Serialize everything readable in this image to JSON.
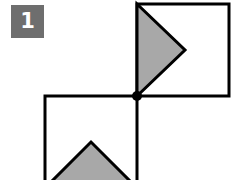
{
  "figure": {
    "label": "1",
    "badge": {
      "icon": "number-badge",
      "fill_color": "#6e6e6e",
      "text_color": "#ffffff",
      "x": 11,
      "y": 5,
      "width": 33,
      "height": 33
    },
    "canvas": {
      "width": 235,
      "height": 180,
      "background_color": "#ffffff"
    },
    "style": {
      "stroke_color": "#000000",
      "stroke_width": 3,
      "shaded_fill_color": "#a8a8a8",
      "unshaded_fill_color": "#ffffff",
      "vertex_dot_color": "#000000"
    },
    "shapes": [
      {
        "name": "upper-right-square",
        "type": "square",
        "points": "137,4 229,4 229,96 137,96",
        "fill": "#ffffff"
      },
      {
        "name": "upper-right-shaded-triangle",
        "type": "triangle",
        "points": "137,4 185,50 137,96",
        "fill": "#a8a8a8",
        "direction": "right-pointing"
      },
      {
        "name": "lower-left-square",
        "type": "square",
        "points": "45,96 137,96 137,188 45,188",
        "fill": "#ffffff"
      },
      {
        "name": "lower-left-shaded-triangle",
        "type": "triangle",
        "points": "45,188 91,142 137,188",
        "fill": "#a8a8a8",
        "direction": "up-pointing"
      }
    ],
    "vertex_dot": {
      "name": "shared-corner-vertex",
      "cx": 137,
      "cy": 96,
      "r": 5
    }
  }
}
